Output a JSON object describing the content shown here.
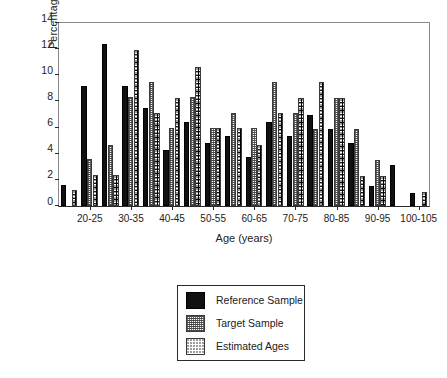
{
  "chart_data": {
    "type": "bar",
    "title": "",
    "xlabel": "Age (years)",
    "ylabel": "Percentage",
    "ylim": [
      0,
      14
    ],
    "ytick_values": [
      0,
      2,
      4,
      6,
      8,
      10,
      12,
      14
    ],
    "ytick_labels": [
      "0",
      "2",
      "4",
      "6",
      "8",
      "10",
      "12",
      "14"
    ],
    "grid": false,
    "legend_position": "below-plot",
    "categories": [
      "15-20",
      "20-25",
      "25-30",
      "30-35",
      "35-40",
      "40-45",
      "45-50",
      "50-55",
      "55-60",
      "60-65",
      "65-70",
      "70-75",
      "75-80",
      "80-85",
      "85-90",
      "90-95",
      "95-100",
      "100-105"
    ],
    "xtick_labels": [
      "20-25",
      "30-35",
      "40-45",
      "50-55",
      "60-65",
      "70-75",
      "80-85",
      "90-95",
      "100-105"
    ],
    "xtick_categories": [
      "20-25",
      "30-35",
      "40-45",
      "50-55",
      "60-65",
      "70-75",
      "80-85",
      "90-95",
      "100-105"
    ],
    "series": [
      {
        "name": "Reference Sample",
        "pattern": "solid-black",
        "color": "#111111",
        "values": [
          1.6,
          9.2,
          12.4,
          9.2,
          7.5,
          4.3,
          6.45,
          4.8,
          5.35,
          3.75,
          6.45,
          5.35,
          6.95,
          5.9,
          4.8,
          1.55,
          3.15,
          1.0
        ]
      },
      {
        "name": "Target Sample",
        "pattern": "dense-grid",
        "color": "#6f6f6f",
        "values": [
          0,
          3.6,
          4.7,
          8.35,
          9.5,
          5.95,
          8.35,
          5.95,
          7.1,
          5.95,
          9.5,
          7.1,
          5.9,
          8.3,
          5.9,
          3.55,
          0,
          0
        ]
      },
      {
        "name": "Estimated Ages",
        "pattern": "sparse-dots",
        "color": "#2b2b2b",
        "values": [
          1.2,
          2.35,
          2.35,
          11.9,
          7.1,
          8.3,
          10.65,
          5.95,
          5.95,
          4.7,
          7.1,
          8.3,
          9.5,
          8.3,
          2.3,
          2.3,
          0,
          1.1
        ]
      }
    ]
  },
  "legend": {
    "entries": [
      {
        "label": "Reference Sample",
        "swatch": "solid-black-swatch"
      },
      {
        "label": "Target Sample",
        "swatch": "dense-grid-swatch"
      },
      {
        "label": "Estimated Ages",
        "swatch": "sparse-dots-swatch"
      }
    ]
  }
}
